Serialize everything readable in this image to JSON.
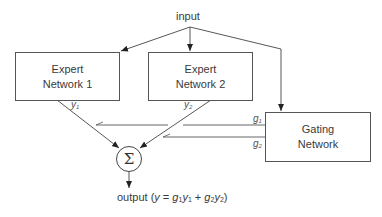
{
  "diagram": {
    "type": "mixture-of-experts",
    "input_label": "input",
    "nodes": {
      "expert1": {
        "line1": "Expert",
        "line2": "Network 1",
        "output_var": "y",
        "output_sub": "1"
      },
      "expert2": {
        "line1": "Expert",
        "line2": "Network 2",
        "output_var": "y",
        "output_sub": "2"
      },
      "gating": {
        "line1": "Gating",
        "line2": "Network",
        "outputs": [
          {
            "var": "g",
            "sub": "1"
          },
          {
            "var": "g",
            "sub": "2"
          }
        ]
      },
      "sum": {
        "symbol": "Σ"
      }
    },
    "output": {
      "prefix": "output (",
      "y": "y",
      "eq": " = ",
      "g1": "g",
      "g1_sub": "1",
      "y1": "y",
      "y1_sub": "1",
      "plus": " + ",
      "g2": "g",
      "g2_sub": "2",
      "y2": "y",
      "y2_sub": "2",
      "suffix": ")"
    },
    "edges": [
      {
        "from": "input",
        "to": "expert1"
      },
      {
        "from": "input",
        "to": "expert2"
      },
      {
        "from": "input",
        "to": "gating"
      },
      {
        "from": "expert1",
        "to": "sum",
        "label": "y1"
      },
      {
        "from": "expert2",
        "to": "sum",
        "label": "y2"
      },
      {
        "from": "gating",
        "to": "sum",
        "label": "g1"
      },
      {
        "from": "gating",
        "to": "sum",
        "label": "g2"
      },
      {
        "from": "sum",
        "to": "output"
      }
    ]
  }
}
